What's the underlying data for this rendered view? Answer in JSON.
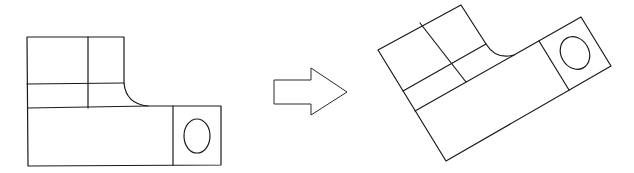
{
  "diagram": {
    "stroke_color": "#1a1a1a",
    "background": "#ffffff",
    "figures": [
      {
        "id": "original",
        "label": "Original orientation",
        "rotation_deg": 0
      },
      {
        "id": "rotated",
        "label": "Rotated orientation",
        "rotation_deg": -29
      }
    ],
    "transform_arrow": {
      "direction": "right",
      "meaning": "transforms into"
    }
  }
}
